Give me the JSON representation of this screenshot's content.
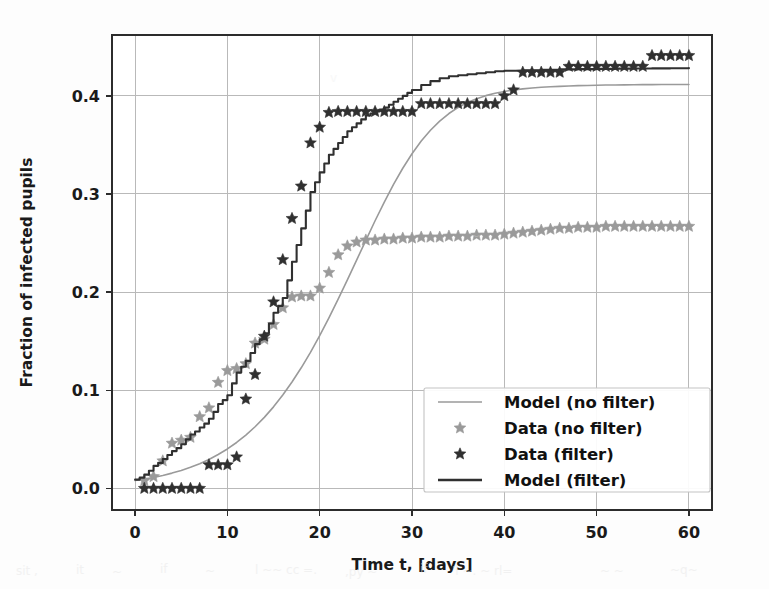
{
  "chart_data": {
    "type": "line",
    "title": "",
    "xlabel": "Time t, [days]",
    "ylabel": "Fraction of infected pupils",
    "xlim": [
      -2.5,
      62.5
    ],
    "ylim": [
      -0.022,
      0.462
    ],
    "xticks": [
      0,
      10,
      20,
      30,
      40,
      50,
      60
    ],
    "xticklabels": [
      "0",
      "10",
      "20",
      "30",
      "40",
      "50",
      "60"
    ],
    "yticks": [
      0.0,
      0.1,
      0.2,
      0.3,
      0.4
    ],
    "yticklabels": [
      "0.0",
      "0.1",
      "0.2",
      "0.3",
      "0.4"
    ],
    "grid": true,
    "legend_position": "center-right",
    "colors": {
      "no_filter": "#9a9a9a",
      "filter": "#303030",
      "grid": "#b9b9b9",
      "axis": "#2c2c2c",
      "background": "#fdfdfd"
    },
    "series": [
      {
        "name": "Model (no filter)",
        "kind": "line",
        "style": "smooth",
        "color": "#9a9a9a",
        "linewidth": 1.6,
        "x": [
          0,
          1,
          2,
          3,
          4,
          5,
          6,
          7,
          8,
          9,
          10,
          11,
          12,
          13,
          14,
          15,
          16,
          17,
          18,
          19,
          20,
          21,
          22,
          23,
          24,
          25,
          26,
          27,
          28,
          29,
          30,
          31,
          32,
          33,
          34,
          35,
          36,
          37,
          38,
          39,
          40,
          41,
          42,
          43,
          44,
          45,
          46,
          47,
          48,
          49,
          50,
          51,
          52,
          53,
          54,
          55,
          56,
          57,
          58,
          59,
          60
        ],
        "y": [
          0.008,
          0.0095,
          0.0112,
          0.0132,
          0.0156,
          0.0183,
          0.0215,
          0.0252,
          0.0295,
          0.0345,
          0.0402,
          0.0468,
          0.0543,
          0.0628,
          0.0724,
          0.0831,
          0.0951,
          0.1084,
          0.1229,
          0.1387,
          0.1557,
          0.1738,
          0.1928,
          0.2125,
          0.2326,
          0.2528,
          0.2727,
          0.2918,
          0.3098,
          0.3262,
          0.341,
          0.3539,
          0.365,
          0.3743,
          0.382,
          0.3882,
          0.3932,
          0.3971,
          0.4002,
          0.4026,
          0.4045,
          0.406,
          0.4071,
          0.408,
          0.4087,
          0.4093,
          0.4097,
          0.4101,
          0.4104,
          0.4106,
          0.4108,
          0.411,
          0.4111,
          0.4112,
          0.4113,
          0.4114,
          0.4114,
          0.4115,
          0.4115,
          0.4116,
          0.4116
        ]
      },
      {
        "name": "Data (no filter)",
        "kind": "markers",
        "marker": "star",
        "color": "#9a9a9a",
        "x": [
          1,
          2,
          3,
          4,
          5,
          6,
          7,
          8,
          9,
          10,
          11,
          12,
          13,
          14,
          15,
          16,
          17,
          18,
          19,
          20,
          21,
          22,
          23,
          24,
          25,
          26,
          27,
          28,
          29,
          30,
          31,
          32,
          33,
          34,
          35,
          36,
          37,
          38,
          39,
          40,
          41,
          42,
          43,
          44,
          45,
          46,
          47,
          48,
          49,
          50,
          51,
          52,
          53,
          54,
          55,
          56,
          57,
          58,
          59,
          60
        ],
        "y": [
          0.008,
          0.012,
          0.028,
          0.046,
          0.049,
          0.052,
          0.073,
          0.082,
          0.108,
          0.12,
          0.122,
          0.127,
          0.148,
          0.152,
          0.167,
          0.184,
          0.195,
          0.196,
          0.196,
          0.204,
          0.22,
          0.238,
          0.247,
          0.251,
          0.253,
          0.253,
          0.254,
          0.254,
          0.255,
          0.255,
          0.256,
          0.256,
          0.256,
          0.257,
          0.257,
          0.257,
          0.258,
          0.258,
          0.258,
          0.259,
          0.26,
          0.261,
          0.262,
          0.263,
          0.264,
          0.265,
          0.265,
          0.266,
          0.266,
          0.266,
          0.267,
          0.267,
          0.267,
          0.267,
          0.267,
          0.267,
          0.267,
          0.267,
          0.267,
          0.267
        ]
      },
      {
        "name": "Data (filter)",
        "kind": "markers",
        "marker": "star",
        "color": "#303030",
        "x": [
          1,
          2,
          3,
          4,
          5,
          6,
          7,
          8,
          9,
          10,
          11,
          12,
          13,
          14,
          15,
          16,
          17,
          18,
          19,
          20,
          21,
          22,
          23,
          24,
          25,
          26,
          27,
          28,
          29,
          30,
          31,
          32,
          33,
          34,
          35,
          36,
          37,
          38,
          39,
          40,
          41,
          42,
          43,
          44,
          45,
          46,
          47,
          48,
          49,
          50,
          51,
          52,
          53,
          54,
          55,
          56,
          57,
          58,
          59,
          60
        ],
        "y": [
          0.0,
          0.0,
          0.0,
          0.0,
          0.0,
          0.0,
          0.0,
          0.024,
          0.024,
          0.024,
          0.032,
          0.091,
          0.116,
          0.155,
          0.19,
          0.233,
          0.275,
          0.308,
          0.352,
          0.368,
          0.383,
          0.384,
          0.384,
          0.384,
          0.384,
          0.384,
          0.384,
          0.384,
          0.384,
          0.384,
          0.392,
          0.392,
          0.392,
          0.392,
          0.392,
          0.392,
          0.392,
          0.392,
          0.392,
          0.4,
          0.406,
          0.424,
          0.424,
          0.424,
          0.424,
          0.424,
          0.43,
          0.43,
          0.43,
          0.43,
          0.43,
          0.43,
          0.43,
          0.43,
          0.43,
          0.441,
          0.441,
          0.441,
          0.441,
          0.441
        ]
      },
      {
        "name": "Model (filter)",
        "kind": "line",
        "style": "step",
        "color": "#303030",
        "linewidth": 2.1,
        "x": [
          0,
          0.5,
          1,
          1.5,
          2,
          2.5,
          3,
          3.5,
          4,
          4.5,
          5,
          5.5,
          6,
          6.5,
          7,
          7.5,
          8,
          8.5,
          9,
          9.5,
          10,
          10.5,
          11,
          11.5,
          12,
          12.5,
          13,
          13.5,
          14,
          14.5,
          15,
          15.5,
          16,
          16.5,
          17,
          17.5,
          18,
          18.5,
          19,
          19.5,
          20,
          20.5,
          21,
          21.5,
          22,
          22.5,
          23,
          23.5,
          24,
          24.5,
          25,
          25.5,
          26,
          26.5,
          27,
          27.5,
          28,
          28.5,
          29,
          29.5,
          30,
          31,
          32,
          33,
          34,
          35,
          36,
          37,
          38,
          39,
          40,
          42,
          44,
          46,
          48,
          50,
          52,
          54,
          56,
          58,
          60
        ],
        "y": [
          0.009,
          0.011,
          0.014,
          0.018,
          0.023,
          0.026,
          0.03,
          0.034,
          0.038,
          0.041,
          0.045,
          0.05,
          0.055,
          0.058,
          0.062,
          0.066,
          0.071,
          0.078,
          0.086,
          0.09,
          0.095,
          0.107,
          0.118,
          0.124,
          0.13,
          0.138,
          0.147,
          0.152,
          0.158,
          0.168,
          0.179,
          0.186,
          0.194,
          0.212,
          0.231,
          0.248,
          0.265,
          0.283,
          0.302,
          0.312,
          0.322,
          0.331,
          0.34,
          0.346,
          0.352,
          0.358,
          0.364,
          0.368,
          0.372,
          0.376,
          0.38,
          0.382,
          0.384,
          0.386,
          0.388,
          0.391,
          0.394,
          0.397,
          0.4,
          0.403,
          0.406,
          0.411,
          0.415,
          0.418,
          0.42,
          0.421,
          0.422,
          0.423,
          0.424,
          0.425,
          0.4255,
          0.426,
          0.4265,
          0.427,
          0.4272,
          0.4275,
          0.4277,
          0.4279,
          0.428,
          0.4281,
          0.4282
        ]
      }
    ],
    "legend_entries": [
      {
        "label": "Model (no filter)",
        "type": "line",
        "color": "#9a9a9a"
      },
      {
        "label": "Data (no filter)",
        "type": "star",
        "color": "#9a9a9a"
      },
      {
        "label": "Data (filter)",
        "type": "star",
        "color": "#303030"
      },
      {
        "label": "Model (filter)",
        "type": "line",
        "color": "#303030"
      }
    ]
  }
}
